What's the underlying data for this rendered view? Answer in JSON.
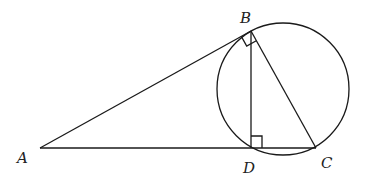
{
  "diagram": {
    "type": "geometry",
    "points": {
      "A": {
        "label": "A",
        "x": 40,
        "y": 148
      },
      "B": {
        "label": "B",
        "x": 251,
        "y": 31
      },
      "C": {
        "label": "C",
        "x": 316,
        "y": 148
      },
      "D": {
        "label": "D",
        "x": 251,
        "y": 148
      }
    },
    "circle": {
      "cx": 283,
      "cy": 89,
      "r": 66
    },
    "segments": [
      "AB",
      "AC",
      "BD",
      "BC"
    ],
    "right_angles": [
      "ABC",
      "BDC"
    ]
  }
}
